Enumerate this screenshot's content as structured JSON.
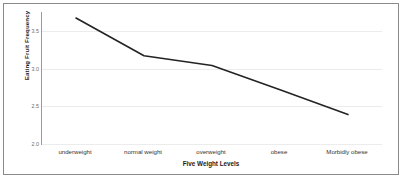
{
  "chart_data": {
    "type": "line",
    "title": "",
    "xlabel": "Five Weight Levels",
    "ylabel": "Eating Fruit Frequency",
    "categories": [
      "underweight",
      "normal weight",
      "overweight",
      "obese",
      "Morbidly obese"
    ],
    "values": [
      3.67,
      3.17,
      3.04,
      2.72,
      2.39
    ],
    "series": [
      {
        "name": "Eating Fruit Frequency",
        "values": [
          3.67,
          3.17,
          3.04,
          2.72,
          2.39
        ]
      }
    ],
    "ylim": [
      2.0,
      3.75
    ],
    "yticks": [
      3.5,
      3.0,
      2.5,
      2.0
    ],
    "ytick_labels": [
      "3.5",
      "3.0",
      "2.5",
      "2.0"
    ],
    "grid": true,
    "legend": false,
    "line_color": "#232323",
    "grid_color": "#ececec",
    "axis_color": "#9a9a9a",
    "border_color": "#8a8a8a"
  }
}
